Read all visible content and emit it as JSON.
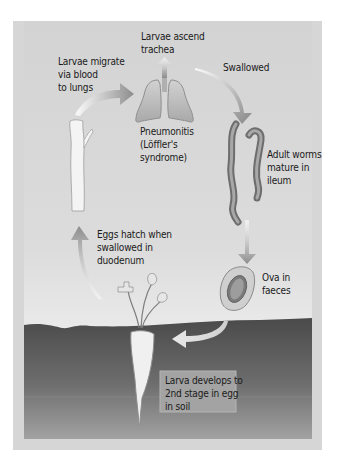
{
  "figure": {
    "title": "",
    "colors": {
      "frame": "#d4d4d4",
      "background": "#d8d8d8",
      "soil_top": "#4f4f4f",
      "soil_bottom": "#9a9a9a",
      "arrow": "#8a8a8a",
      "text": "#1a1a1a"
    }
  },
  "labels": {
    "larvae_ascend": "Larvae ascend\ntrachea",
    "larvae_migrate": "Larvae migrate\nvia blood\nto lungs",
    "swallowed": "Swallowed",
    "pneumonitis": "Pneumonitis\n(Löffler's\nsyndrome)",
    "adult_worms": "Adult worms\nmature in\nileum",
    "eggs_hatch": "Eggs hatch when\nswallowed in\nduodenum",
    "ova": "Ova in\nfaeces",
    "larva_develops": "Larva develops to\n2nd stage in egg\nin soil"
  },
  "illustrations": [
    "blood-vessel-icon",
    "lungs-icon",
    "adult-worms-icon",
    "ovum-icon",
    "vegetable-icon",
    "soil-area"
  ]
}
